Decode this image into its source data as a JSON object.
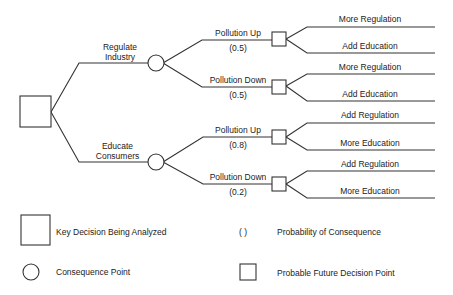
{
  "tree": {
    "root": {
      "shape": "square",
      "meaning": "Key Decision Being Analyzed"
    },
    "options": [
      {
        "label_line1": "Regulate",
        "label_line2": "Industry",
        "outcomes": [
          {
            "label": "Pollution Up",
            "prob": "(0.5)",
            "actions": [
              "More Regulation",
              "Add Education"
            ]
          },
          {
            "label": "Pollution Down",
            "prob": "(0.5)",
            "actions": [
              "More Regulation",
              "Add Education"
            ]
          }
        ]
      },
      {
        "label_line1": "Educate",
        "label_line2": "Consumers",
        "outcomes": [
          {
            "label": "Pollution Up",
            "prob": "(0.8)",
            "actions": [
              "Add Regulation",
              "More Education"
            ]
          },
          {
            "label": "Pollution Down",
            "prob": "(0.2)",
            "actions": [
              "Add Regulation",
              "More Education"
            ]
          }
        ]
      }
    ]
  },
  "legend": {
    "key_decision": "Key Decision Being Analyzed",
    "consequence_point": "Consequence Point",
    "probability_symbol": "(   )",
    "probability": "Probability of Consequence",
    "future_decision": "Probable Future Decision Point"
  },
  "colors": {
    "line": "#333333",
    "text": "#222222",
    "background": "#ffffff"
  }
}
